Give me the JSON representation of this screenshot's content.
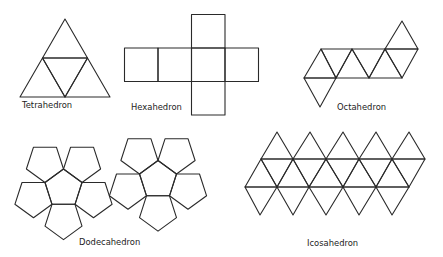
{
  "nets": [
    {
      "id": "tetrahedron",
      "label": "Tetrahedron",
      "face_shape": "triangle",
      "faces": 4
    },
    {
      "id": "hexahedron",
      "label": "Hexahedron",
      "face_shape": "square",
      "faces": 6
    },
    {
      "id": "octahedron",
      "label": "Octahedron",
      "face_shape": "triangle",
      "faces": 8
    },
    {
      "id": "dodecahedron",
      "label": "Dodecahedron",
      "face_shape": "pentagon",
      "faces": 12
    },
    {
      "id": "icosahedron",
      "label": "Icosahedron",
      "face_shape": "triangle",
      "faces": 20
    }
  ],
  "colors": {
    "line": "#2a2a2a",
    "background": "#ffffff",
    "text": "#222222"
  }
}
